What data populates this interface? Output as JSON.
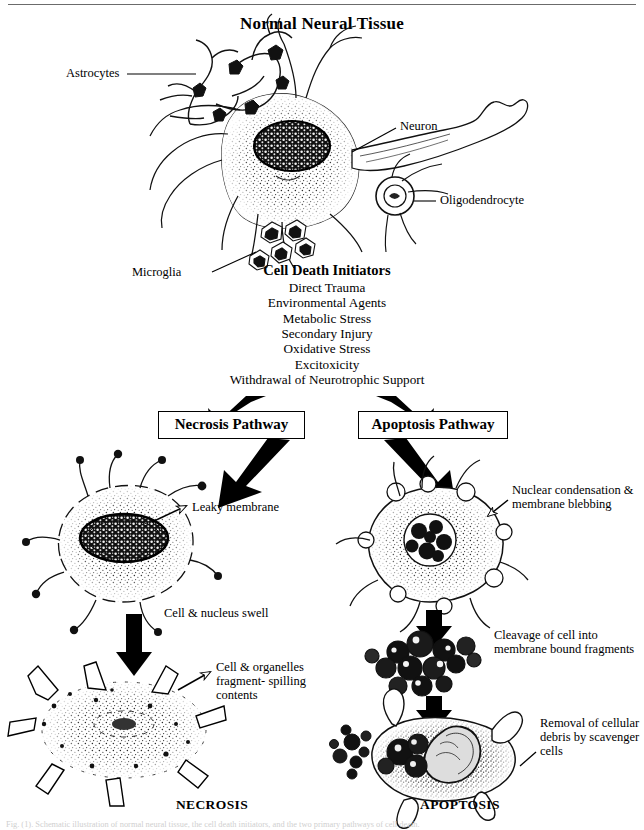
{
  "title": "Normal Neural Tissue",
  "top_labels": [
    {
      "name": "astrocytes",
      "text": "Astrocytes"
    },
    {
      "name": "neuron",
      "text": "Neuron"
    },
    {
      "name": "oligodendrocyte",
      "text": "Oligodendrocyte"
    },
    {
      "name": "microglia",
      "text": "Microglia"
    }
  ],
  "initiators": {
    "heading": "Cell Death Initiators",
    "items": [
      "Direct Trauma",
      "Environmental Agents",
      "Metabolic Stress",
      "Secondary Injury",
      "Oxidative Stress",
      "Excitoxicity",
      "Withdrawal of Neurotrophic Support"
    ]
  },
  "pathways": {
    "necrosis": {
      "box_label": "Necrosis Pathway",
      "outcome_label": "NECROSIS",
      "annotations": [
        "Leaky membrane",
        "Cell & nucleus swell",
        "Cell & organelles\nfragment- spilling\ncontents"
      ]
    },
    "apoptosis": {
      "box_label": "Apoptosis Pathway",
      "outcome_label": "APOPTOSIS",
      "annotations": [
        "Nuclear condensation\n& membrane blebbing",
        "Cleavage of cell into\nmembrane bound fragments",
        "Removal of\ncellular debris by\nscavenger cells"
      ]
    }
  },
  "annotation_text": {
    "leaky_membrane": "Leaky membrane",
    "cell_nucleus_swell": "Cell & nucleus swell",
    "fragment_spilling": "Cell & organelles fragment- spilling contents",
    "nuclear_condensation": "Nuclear condensation & membrane blebbing",
    "cleavage": "Cleavage of cell into membrane bound fragments",
    "removal": "Removal of cellular debris by scavenger cells"
  },
  "caption": "Fig. (1). Schematic illustration of normal neural tissue, the cell death initiators, and the two primary pathways of cell death.",
  "colors": {
    "ink": "#000000",
    "paper": "#ffffff",
    "rule": "#6b6b6b"
  }
}
